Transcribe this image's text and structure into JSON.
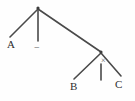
{
  "diagram": {
    "type": "tree",
    "title": "",
    "background_color": "#fefefe",
    "stroke_color": "#4a4a4a",
    "text_color": "#2e2e2e",
    "nodes": [
      {
        "id": "root",
        "label": "",
        "x": 38,
        "y": 8
      },
      {
        "id": "right",
        "label": "",
        "x": 101,
        "y": 52
      }
    ],
    "leaves": [
      {
        "id": "leaf-a",
        "label": "A",
        "x": 7,
        "y": 39
      },
      {
        "id": "leaf-b",
        "label": "B",
        "x": 70,
        "y": 81
      },
      {
        "id": "leaf-c",
        "label": "C",
        "x": 115,
        "y": 79
      }
    ],
    "operators": [
      {
        "id": "op-minus",
        "label": "−",
        "x": 34,
        "y": 43
      },
      {
        "id": "op-times",
        "label": "×",
        "x": 101,
        "y": 60
      }
    ],
    "edges": [
      {
        "id": "edge-root-a",
        "from": "root",
        "to": "leaf-a",
        "x1": 38,
        "y1": 9,
        "x2": 10,
        "y2": 37
      },
      {
        "id": "edge-root-minus",
        "from": "root",
        "to": "op-minus",
        "x1": 38,
        "y1": 9,
        "x2": 38,
        "y2": 41
      },
      {
        "id": "edge-root-right",
        "from": "root",
        "to": "right",
        "x1": 38,
        "y1": 9,
        "x2": 101,
        "y2": 52
      },
      {
        "id": "edge-right-b",
        "from": "right",
        "to": "leaf-b",
        "x1": 101,
        "y1": 53,
        "x2": 74,
        "y2": 79
      },
      {
        "id": "edge-right-times",
        "from": "right",
        "to": "op-times",
        "x1": 101,
        "y1": 57,
        "x2": 101,
        "y2": 79
      },
      {
        "id": "edge-right-c",
        "from": "right",
        "to": "leaf-c",
        "x1": 101,
        "y1": 53,
        "x2": 121,
        "y2": 76
      }
    ]
  }
}
